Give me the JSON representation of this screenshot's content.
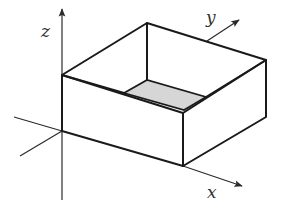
{
  "axes": {
    "x": {
      "label": "x"
    },
    "y": {
      "label": "y"
    },
    "z": {
      "label": "z"
    }
  },
  "box": {
    "description": "open-top rectangular box",
    "bottom_fill": "#d6d6d6",
    "edge_color": "#1a1a1a"
  },
  "colors": {
    "background": "#ffffff",
    "axis": "#2a2a2a",
    "shaded_base": "#d6d6d6"
  }
}
